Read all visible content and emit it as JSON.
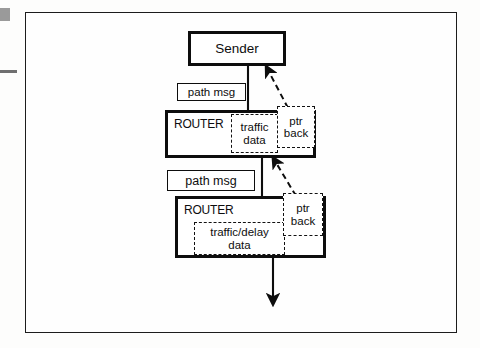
{
  "figure": {
    "type": "network-protocol-flow-diagram"
  },
  "nodes": {
    "sender": {
      "label": "Sender",
      "shape": "rectangle",
      "border": "thick-solid"
    },
    "router_1": {
      "label": "ROUTER",
      "shape": "rectangle",
      "border": "thick-solid",
      "state_blocks": [
        {
          "id": "traffic-data-1",
          "lines": [
            "traffic",
            "data"
          ],
          "border": "dashed"
        },
        {
          "id": "ptr-back-1",
          "lines": [
            "ptr",
            "back"
          ],
          "border": "dashed"
        }
      ]
    },
    "router_2": {
      "label": "ROUTER",
      "shape": "rectangle",
      "border": "thick-solid",
      "state_blocks": [
        {
          "id": "traffic-delay-data-2",
          "lines": [
            "traffic/delay",
            "data"
          ],
          "border": "dashed"
        },
        {
          "id": "ptr-back-2",
          "lines": [
            "ptr",
            "back"
          ],
          "border": "dashed"
        }
      ]
    }
  },
  "message_labels": {
    "path_msg_1": "path msg",
    "path_msg_2": "path msg"
  },
  "edges": [
    {
      "id": "sender-to-router1",
      "from": "sender",
      "to": "router_1",
      "style": "solid",
      "arrow": "down"
    },
    {
      "id": "router1-to-router2",
      "from": "router_1",
      "to": "router_2",
      "style": "solid",
      "arrow": "down"
    },
    {
      "id": "router2-downstream",
      "from": "router_2",
      "to": "downstream",
      "style": "solid",
      "arrow": "down"
    },
    {
      "id": "ptrback1-to-sender",
      "from": "ptr-back-1",
      "to": "sender",
      "style": "dashed",
      "arrow": "up-left"
    },
    {
      "id": "ptrback2-to-router1",
      "from": "ptr-back-2",
      "to": "router_1",
      "style": "dashed",
      "arrow": "up-left"
    }
  ],
  "colors": {
    "ink": "#0d0d0d",
    "frame": "#1c1c1c",
    "page": "#fefefe",
    "canvas": "#fdfdfc",
    "artifact": "#9a9a9a"
  }
}
